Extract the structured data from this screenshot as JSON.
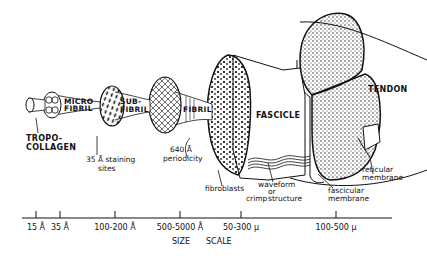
{
  "levels": [
    {
      "name": "TROPO-",
      "name2": "COLLAGEN",
      "size": "15 Å"
    },
    {
      "name": "MICRO",
      "name2": "FIBRIL",
      "size": "35 Å"
    },
    {
      "name": "SUB-",
      "name2": "FIBRIL",
      "size": "100-200 Å"
    },
    {
      "name": "FIBRIL",
      "size": "500-5000 Å"
    },
    {
      "name": "FASCICLE",
      "size": "50-300 μ"
    },
    {
      "name": "TENDON",
      "size": "100-500 μ"
    }
  ],
  "annotations": {
    "staining": "35 Å  staining",
    "staining2": "sites",
    "periodicity": "640 Å",
    "periodicity2": "periodicity",
    "fibroblasts": "fibroblasts",
    "waveform": "waveform",
    "waveform_or": "or",
    "crimp": "crimp",
    "structure": "structure",
    "fascicular": "fascicular",
    "fascicular2": "membrane",
    "reticular": "reticular",
    "reticular2": "membrane"
  },
  "scale": {
    "ticks": [
      "15 Å",
      "35 Å",
      "100-200 Å",
      "500-5000 Å",
      "50-300 μ",
      "100-500 μ"
    ],
    "label_size": "SIZE",
    "label_scale": "SCALE"
  },
  "colors": {
    "ink": "#111111",
    "paper": "#ffffff"
  }
}
